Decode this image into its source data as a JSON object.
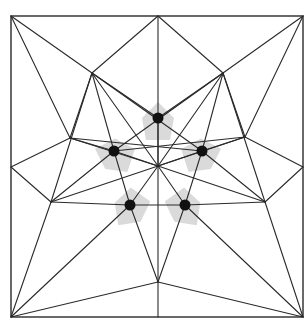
{
  "diagram": {
    "type": "origami-crease-pattern",
    "colors": {
      "line": "#2a2a2a",
      "patch": "#d4d4d4",
      "dot": "#111111",
      "background": "#ffffff"
    },
    "square": {
      "x1": 11,
      "y1": 16,
      "x2": 303,
      "y2": 317
    },
    "vertices": {
      "TL": [
        11,
        16
      ],
      "TR": [
        303,
        16
      ],
      "BL": [
        11,
        317
      ],
      "BR": [
        303,
        317
      ],
      "TM": [
        158,
        16
      ],
      "BM": [
        158,
        317
      ],
      "LM": [
        11,
        167
      ],
      "RM": [
        303,
        167
      ],
      "C": [
        158,
        166
      ],
      "UL": [
        92,
        73
      ],
      "UR": [
        223,
        73
      ],
      "ML": [
        70,
        138
      ],
      "MR": [
        245,
        137
      ],
      "LL": [
        51,
        202
      ],
      "LR": [
        265,
        202
      ],
      "B": [
        158,
        282
      ]
    },
    "dots": [
      {
        "name": "dot-top",
        "x": 158,
        "y": 118,
        "angle": 0
      },
      {
        "name": "dot-upper-left",
        "x": 114,
        "y": 151,
        "angle": -72
      },
      {
        "name": "dot-upper-right",
        "x": 202,
        "y": 151,
        "angle": 72
      },
      {
        "name": "dot-lower-left",
        "x": 130,
        "y": 205,
        "angle": -144
      },
      {
        "name": "dot-lower-right",
        "x": 185,
        "y": 205,
        "angle": 144
      }
    ],
    "edges": [
      [
        "TL",
        "UL"
      ],
      [
        "UL",
        "TM"
      ],
      [
        "TM",
        "UR"
      ],
      [
        "UR",
        "TR"
      ],
      [
        "TM",
        "C"
      ],
      [
        "C",
        "BM"
      ],
      [
        "TL",
        "ML"
      ],
      [
        "TR",
        "MR"
      ],
      [
        "LM",
        "ML"
      ],
      [
        "LM",
        "LL"
      ],
      [
        "RM",
        "MR"
      ],
      [
        "RM",
        "LR"
      ],
      [
        "BL",
        "LL"
      ],
      [
        "BR",
        "LR"
      ],
      [
        "BL",
        "B"
      ],
      [
        "BR",
        "B"
      ],
      [
        "UL",
        "ML"
      ],
      [
        "UR",
        "MR"
      ],
      [
        "UL",
        "LL"
      ],
      [
        "UR",
        "LR"
      ],
      [
        "UL",
        "C"
      ],
      [
        "UR",
        "C"
      ],
      [
        "UL",
        "D0"
      ],
      [
        "UR",
        "D0"
      ],
      [
        "UL",
        "D2"
      ],
      [
        "UR",
        "D1"
      ],
      [
        "ML",
        "D1"
      ],
      [
        "MR",
        "D2"
      ],
      [
        "ML",
        "C"
      ],
      [
        "MR",
        "C"
      ],
      [
        "LL",
        "D1"
      ],
      [
        "LR",
        "D2"
      ],
      [
        "LL",
        "D3"
      ],
      [
        "LR",
        "D4"
      ],
      [
        "LL",
        "C"
      ],
      [
        "LR",
        "C"
      ],
      [
        "BL",
        "D3"
      ],
      [
        "BR",
        "D4"
      ],
      [
        "D3",
        "B"
      ],
      [
        "D4",
        "B"
      ],
      [
        "D3",
        "D4"
      ],
      [
        "D3",
        "C"
      ],
      [
        "D4",
        "C"
      ],
      [
        "D1",
        "C"
      ],
      [
        "D2",
        "C"
      ],
      [
        "D0",
        "C"
      ],
      [
        "UL",
        "D1"
      ],
      [
        "UR",
        "D2"
      ],
      [
        "D1",
        "D3"
      ],
      [
        "D2",
        "D4"
      ],
      [
        "ML",
        "D2x"
      ],
      [
        "MR",
        "D1x"
      ]
    ]
  }
}
